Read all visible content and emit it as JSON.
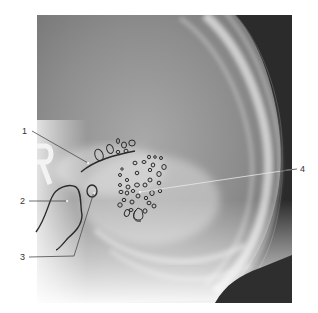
{
  "figure": {
    "type": "lateral skull radiograph with annotations",
    "labels": [
      {
        "id": "1",
        "text": "1",
        "x": 22,
        "y": 127
      },
      {
        "id": "2",
        "text": "2",
        "x": 20,
        "y": 197
      },
      {
        "id": "3",
        "text": "3",
        "x": 20,
        "y": 253
      },
      {
        "id": "4",
        "text": "4",
        "x": 300,
        "y": 165
      }
    ],
    "overlay_marker": {
      "text": "R"
    },
    "colors": {
      "background": "#ffffff",
      "film_dark": "#2a2a2a",
      "film_mid": "#8a8a8a",
      "bone_light": "#e6e6e6",
      "outline": "#2b2b2b",
      "leader_line": "#4a4a4a",
      "leader_line_light": "#f0f0f0"
    }
  }
}
